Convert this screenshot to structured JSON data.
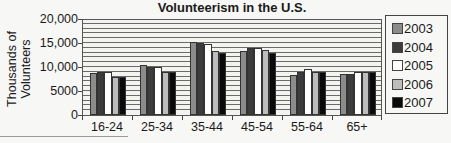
{
  "chart_data": {
    "type": "bar",
    "title": "Volunteerism in the U.S.",
    "xlabel": "",
    "ylabel": "Thousands of Volunteers",
    "ylim": [
      0,
      20000
    ],
    "yticks": [
      "0",
      "5000",
      "10,000",
      "15,000",
      "20,000"
    ],
    "ytick_values": [
      0,
      5000,
      10000,
      15000,
      20000
    ],
    "grid": {
      "horizontal": true,
      "interval": 1000
    },
    "legend_position": "right",
    "categories": [
      "16-24",
      "25-34",
      "35-44",
      "45-54",
      "55-64",
      "65+"
    ],
    "series": [
      {
        "name": "2003",
        "color": "#8c8c8c",
        "values": [
          8800,
          10400,
          15300,
          13400,
          8400,
          8500
        ]
      },
      {
        "name": "2004",
        "color": "#3c3c3c",
        "values": [
          9000,
          10100,
          15000,
          13900,
          9000,
          8600
        ]
      },
      {
        "name": "2005",
        "color": "#ffffff",
        "values": [
          8900,
          9900,
          14800,
          13900,
          9500,
          8900
        ]
      },
      {
        "name": "2006",
        "color": "#bdbdbd",
        "values": [
          8000,
          9000,
          13400,
          13600,
          9000,
          8900
        ]
      },
      {
        "name": "2007",
        "color": "#0a0a0a",
        "values": [
          7900,
          9000,
          13000,
          13000,
          9000,
          9000
        ]
      }
    ]
  }
}
